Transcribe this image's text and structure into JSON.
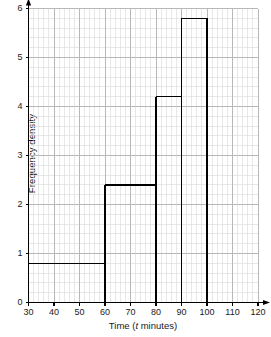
{
  "chart_data": {
    "type": "bar",
    "title": "",
    "subtitle": "",
    "xlabel": "Time (t minutes)",
    "xlabel_parts": {
      "before": "Time (",
      "italic": "t",
      "after": " minutes)"
    },
    "ylabel": "Frequency density",
    "xlim": [
      30,
      120
    ],
    "ylim": [
      0,
      6
    ],
    "xticks": [
      30,
      40,
      50,
      60,
      70,
      80,
      90,
      100,
      110,
      120
    ],
    "xtick_labels": [
      "30",
      "40",
      "50",
      "60",
      "70",
      "80",
      "90",
      "100",
      "110",
      "120"
    ],
    "yticks": [
      0,
      1,
      2,
      3,
      4,
      5,
      6
    ],
    "ytick_labels": [
      "0",
      "1",
      "2",
      "3",
      "4",
      "5",
      "6"
    ],
    "grid": true,
    "minor_grid": true,
    "minor_grid_step_x": 2,
    "minor_grid_step_y": 0.2,
    "legend": "none",
    "bar_style": "outline",
    "bar_color": "#000000",
    "grid_color": "#b8b8b8",
    "minor_grid_color": "#d8d8d8",
    "axis_color": "#000000",
    "categories": [
      "30-60",
      "60-80",
      "80-90",
      "90-100",
      "100-120"
    ],
    "bins": [
      {
        "x_start": 30,
        "x_end": 60,
        "value": 0.8,
        "frequency": 24
      },
      {
        "x_start": 60,
        "x_end": 80,
        "value": 2.4,
        "frequency": 48
      },
      {
        "x_start": 80,
        "x_end": 90,
        "value": 4.2,
        "frequency": 42
      },
      {
        "x_start": 90,
        "x_end": 100,
        "value": 5.8,
        "frequency": 58
      },
      {
        "x_start": 100,
        "x_end": 120,
        "value": 0.0,
        "frequency": 0
      }
    ],
    "values": [
      0.8,
      2.4,
      4.2,
      5.8,
      0.0
    ]
  },
  "axes": {
    "y_title": "Frequency density",
    "x_title": "Time (t minutes)"
  }
}
